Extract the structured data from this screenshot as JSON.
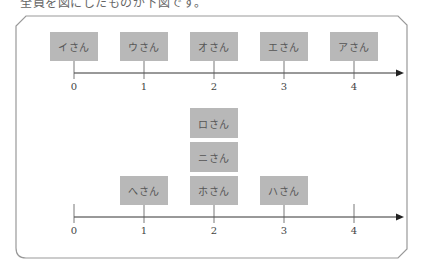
{
  "caption": "全員を図にしたものが下図です。",
  "top_diagram": {
    "axis_ticks": [
      "0",
      "1",
      "2",
      "3",
      "4"
    ],
    "boxes": [
      {
        "label": "イさん",
        "position": 0
      },
      {
        "label": "ウさん",
        "position": 1
      },
      {
        "label": "オさん",
        "position": 2
      },
      {
        "label": "エさん",
        "position": 3
      },
      {
        "label": "アさん",
        "position": 4
      }
    ]
  },
  "bottom_diagram": {
    "axis_ticks": [
      "0",
      "1",
      "2",
      "3",
      "4"
    ],
    "boxes": [
      {
        "label": "へさん",
        "position": 1,
        "stack": 0
      },
      {
        "label": "ホさん",
        "position": 2,
        "stack": 0
      },
      {
        "label": "ニさん",
        "position": 2,
        "stack": 1
      },
      {
        "label": "ロさん",
        "position": 2,
        "stack": 2
      },
      {
        "label": "ハさん",
        "position": 3,
        "stack": 0
      }
    ]
  },
  "colors": {
    "box_fill": "#b8b8b8",
    "axis": "#333333",
    "frame": "#999999"
  }
}
